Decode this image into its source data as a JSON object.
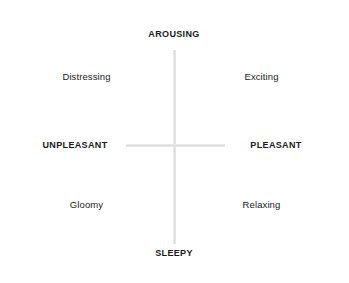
{
  "diagram": {
    "background_color": "#ffffff",
    "axis_color": "#dcdcdc",
    "fill_gray_color": "#a9a9a9",
    "fill_white_color": "#ffffff",
    "text_color": "#1a1a1a",
    "axes": {
      "vertical": {
        "label_top": "AROUSING",
        "label_bottom": "SLEEPY"
      },
      "horizontal": {
        "label_left": "UNPLEASANT",
        "label_right": "PLEASANT"
      }
    },
    "nodes": [
      {
        "id": "arousing",
        "label": "AROUSING",
        "position": "top",
        "fill": "gray",
        "weight": "bold"
      },
      {
        "id": "distressing",
        "label": "Distressing",
        "position": "upper-left",
        "fill": "gray",
        "weight": "regular"
      },
      {
        "id": "exciting",
        "label": "Exciting",
        "position": "upper-right",
        "fill": "white",
        "weight": "regular"
      },
      {
        "id": "unpleasant",
        "label": "UNPLEASANT",
        "position": "left",
        "fill": "white",
        "weight": "bold"
      },
      {
        "id": "pleasant",
        "label": "PLEASANT",
        "position": "right",
        "fill": "gray",
        "weight": "bold"
      },
      {
        "id": "gloomy",
        "label": "Gloomy",
        "position": "lower-left",
        "fill": "gray",
        "weight": "regular"
      },
      {
        "id": "relaxing",
        "label": "Relaxing",
        "position": "lower-right",
        "fill": "gray",
        "weight": "regular"
      },
      {
        "id": "sleepy",
        "label": "SLEEPY",
        "position": "bottom",
        "fill": "gray",
        "weight": "bold"
      }
    ]
  }
}
